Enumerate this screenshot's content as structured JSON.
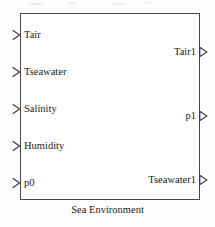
{
  "diagram": {
    "block_name": "Sea Environment",
    "caption": "Sea Environment",
    "border_color": "#4a4a4a",
    "text_color": "#1c1c1c",
    "background_color": "#ffffff",
    "inputs": [
      {
        "label": "Tair",
        "arrow": "input-arrow-icon"
      },
      {
        "label": "Tseawater",
        "arrow": "input-arrow-icon"
      },
      {
        "label": "Salinity",
        "arrow": "input-arrow-icon"
      },
      {
        "label": "Humidity",
        "arrow": "input-arrow-icon"
      },
      {
        "label": "p0",
        "arrow": "input-arrow-icon"
      }
    ],
    "outputs": [
      {
        "label": "Tair1",
        "arrow": "output-arrow-icon"
      },
      {
        "label": "p1",
        "arrow": "output-arrow-icon"
      },
      {
        "label": "Tseawater1",
        "arrow": "output-arrow-icon"
      }
    ]
  }
}
